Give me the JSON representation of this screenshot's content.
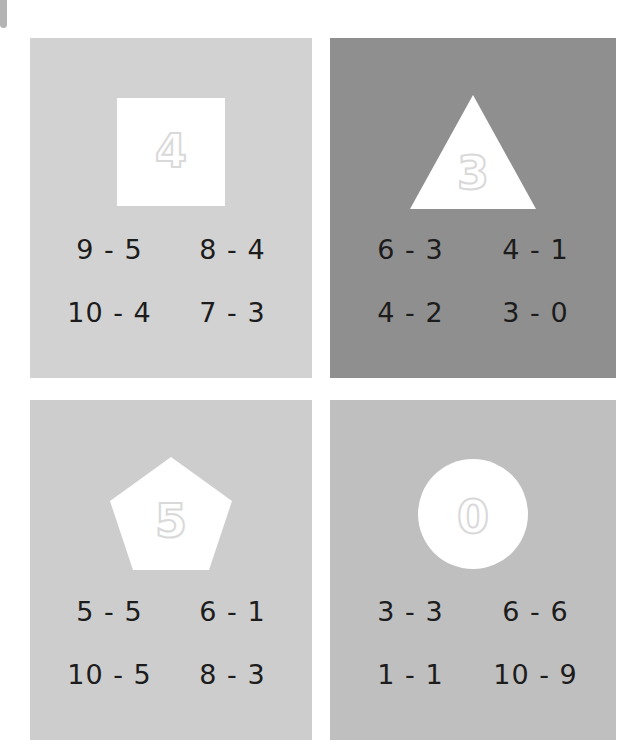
{
  "page": {
    "background_color": "#ffffff",
    "width": 644,
    "height": 756,
    "edge_tab_color": "#b3b3b3"
  },
  "worksheet": {
    "digit_outline_color": "#d9d9d9",
    "shape_fill_color": "#ffffff",
    "equation_text_color": "#1c1c1c",
    "cards": [
      {
        "id": "card-square-4",
        "shape": "square",
        "shape_icon_name": "square-shape-icon",
        "answer": "4",
        "background_color": "#d2d2d2",
        "equations": [
          {
            "text": "9 - 5"
          },
          {
            "text": "8 - 4"
          },
          {
            "text": "10 - 4"
          },
          {
            "text": "7 - 3"
          }
        ]
      },
      {
        "id": "card-triangle-3",
        "shape": "triangle",
        "shape_icon_name": "triangle-shape-icon",
        "answer": "3",
        "background_color": "#8f8f8f",
        "equations": [
          {
            "text": "6 - 3"
          },
          {
            "text": "4 - 1"
          },
          {
            "text": "4 - 2"
          },
          {
            "text": "3 - 0"
          }
        ]
      },
      {
        "id": "card-pentagon-5",
        "shape": "pentagon",
        "shape_icon_name": "pentagon-shape-icon",
        "answer": "5",
        "background_color": "#cdcdcd",
        "equations": [
          {
            "text": "5 - 5"
          },
          {
            "text": "6 - 1"
          },
          {
            "text": "10 - 5"
          },
          {
            "text": "8 - 3"
          }
        ]
      },
      {
        "id": "card-circle-0",
        "shape": "circle",
        "shape_icon_name": "circle-shape-icon",
        "answer": "0",
        "background_color": "#bfbfbf",
        "equations": [
          {
            "text": "3 - 3"
          },
          {
            "text": "6 - 6"
          },
          {
            "text": "1 - 1"
          },
          {
            "text": "10 - 9"
          }
        ]
      }
    ]
  }
}
